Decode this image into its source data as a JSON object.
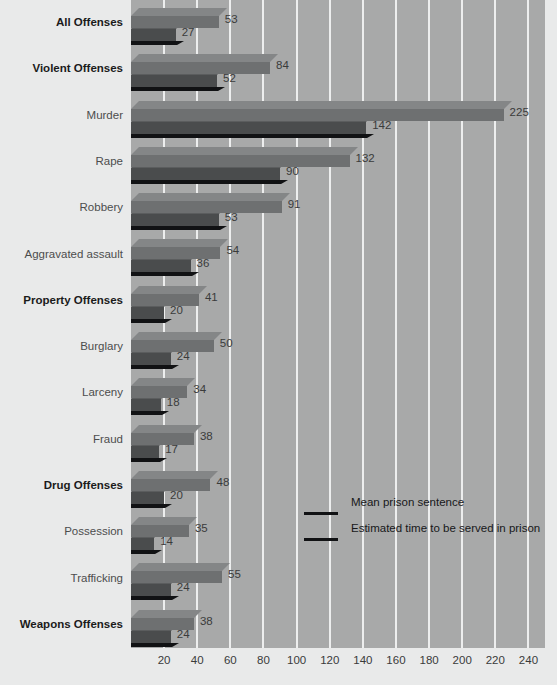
{
  "chart_data": {
    "type": "bar",
    "orientation": "horizontal",
    "title": "",
    "xlabel": "",
    "ylabel": "",
    "xlim": [
      0,
      250
    ],
    "grid": true,
    "gridlines": [
      20,
      40,
      60,
      80,
      100,
      120,
      140,
      160,
      180,
      200,
      220,
      240
    ],
    "xticks": [
      "20",
      "40",
      "60",
      "80",
      "100",
      "120",
      "140",
      "160",
      "180",
      "200",
      "220",
      "240"
    ],
    "legend_position": "inside-right-middle",
    "categories": [
      "All Offenses",
      "Violent Offenses",
      "Murder",
      "Rape",
      "Robbery",
      "Aggravated assault",
      "Property Offenses",
      "Burglary",
      "Larceny",
      "Fraud",
      "Drug Offenses",
      "Possession",
      "Trafficking",
      "Weapons Offenses"
    ],
    "category_emphasis": [
      true,
      true,
      false,
      false,
      false,
      false,
      true,
      false,
      false,
      false,
      true,
      false,
      false,
      true
    ],
    "series": [
      {
        "name": "Mean prison sentence",
        "color": "#6e7071",
        "values": [
          53,
          84,
          225,
          132,
          91,
          54,
          41,
          50,
          34,
          38,
          48,
          35,
          55,
          38
        ]
      },
      {
        "name": "Estimated time to be served in prison",
        "color": "#4a4c4d",
        "values": [
          27,
          52,
          142,
          90,
          53,
          36,
          20,
          24,
          18,
          17,
          20,
          14,
          24,
          24
        ]
      }
    ]
  },
  "legend": {
    "entries": [
      {
        "label": "Mean prison sentence"
      },
      {
        "label": "Estimated time to be served in prison"
      }
    ]
  },
  "colors": {
    "page_background": "#e9eaea",
    "plot_background": "#a8a9a9",
    "gridline": "#edeeee",
    "series1_top": "#848687",
    "series1_front": "#6e7071",
    "series2_top": "#5b5d5e",
    "series2_front": "#4a4c4d",
    "bar_shadow": "#111214",
    "label_text": "#4c4d4d",
    "label_text_bold": "#1b1b1b",
    "value_text": "#3a3b3b"
  }
}
